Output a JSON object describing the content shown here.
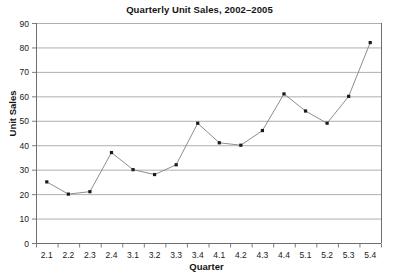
{
  "chart_data": {
    "type": "line",
    "title": "Quarterly Unit Sales, 2002–2005",
    "xlabel": "Quarter",
    "ylabel": "Unit Sales",
    "categories": [
      "2.1",
      "2.2",
      "2.3",
      "2.4",
      "3.1",
      "3.2",
      "3.3",
      "3.4",
      "4.1",
      "4.2",
      "4.3",
      "4.4",
      "5.1",
      "5.2",
      "5.3",
      "5.4"
    ],
    "values": [
      25,
      20,
      21,
      37,
      30,
      28,
      32,
      49,
      41,
      40,
      46,
      61,
      54,
      49,
      60,
      82
    ],
    "ylim": [
      0,
      90
    ],
    "yticks": [
      0,
      10,
      20,
      30,
      40,
      50,
      60,
      70,
      80,
      90
    ],
    "grid": "horizontal",
    "legend": "none",
    "marker": "square",
    "series_color": "#808080",
    "marker_color": "#1a1a1a",
    "grid_color": "#9a9a9a",
    "axis_color": "#6e6e6e",
    "background": "#ffffff"
  }
}
